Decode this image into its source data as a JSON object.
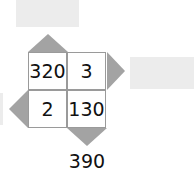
{
  "grid": {
    "cells": [
      "320",
      "3",
      "2",
      "130"
    ]
  },
  "bottom_result": "390",
  "answer_boxes": {
    "top": "",
    "right": "",
    "left": ""
  },
  "colors": {
    "triangle": "#a3a3a3",
    "answer_box": "#ececec",
    "border": "#9a9a9a"
  }
}
